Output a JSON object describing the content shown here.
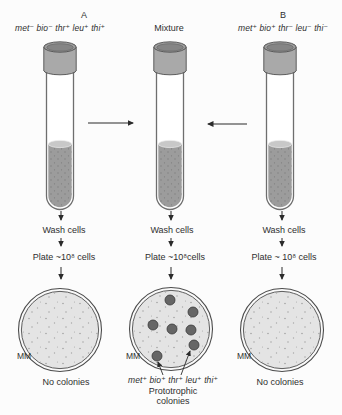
{
  "figure": {
    "panels": {
      "a": {
        "title": "A",
        "genotype": "met⁻ bio⁻ thr⁺ leu⁺ thi⁺",
        "wash_label": "Wash cells",
        "plate_label": "Plate ~10⁸ cells",
        "dish_label": "MM",
        "result": "No colonies"
      },
      "mixture": {
        "title": "Mixture",
        "wash_label": "Wash cells",
        "plate_label": "Plate ~10⁸cells",
        "dish_label": "MM",
        "colony_genotype": "met⁺ bio⁺ thr⁺ leu⁺ thi⁺",
        "caption_line1": "Prototrophic",
        "caption_line2": "colonies",
        "colony_radius": 5,
        "colonies": [
          {
            "x": 170,
            "y": 300
          },
          {
            "x": 193,
            "y": 312
          },
          {
            "x": 153,
            "y": 325
          },
          {
            "x": 172,
            "y": 329
          },
          {
            "x": 191,
            "y": 330
          },
          {
            "x": 194,
            "y": 345
          },
          {
            "x": 157,
            "y": 356
          }
        ]
      },
      "b": {
        "title": "B",
        "genotype": "met⁺ bio⁺ thr⁻ leu⁻ thi⁻",
        "wash_label": "Wash cells",
        "plate_label": "Plate ~ 10⁸ cells",
        "dish_label": "MM",
        "result": "No colonies"
      }
    },
    "colors": {
      "liquid": "#9c9c9c",
      "cap": "#a9a9a9",
      "dish_fill": "#e4e4e4",
      "colony": "#666666",
      "arrow": "#2b2b2b"
    }
  }
}
